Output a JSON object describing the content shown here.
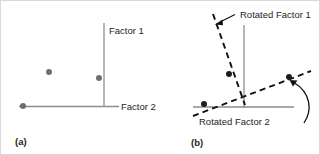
{
  "figure": {
    "width": 320,
    "height": 155,
    "background": "#ffffff",
    "type": "statistical-diagram"
  },
  "colors": {
    "axis_gray": "#8d8d8d",
    "point_gray": "#6e6e6e",
    "point_dark": "#1d1d1d",
    "dashed_black": "#111111",
    "text": "#231f20",
    "background": "#ffffff"
  },
  "panel_a": {
    "caption": "(a)",
    "vertical_axis_label": "Factor 1",
    "horizontal_axis_label": "Factor 2",
    "axes": {
      "vertical_x": 103,
      "vertical_y_top": 22,
      "vertical_y_bottom": 106,
      "horizontal_y": 105.5,
      "horizontal_x_left": 18,
      "horizontal_x_right": 118
    },
    "points": [
      {
        "name": "point-left-on-axis",
        "x": 22,
        "y": 105,
        "r": 3.0
      },
      {
        "name": "point-upper-middle",
        "x": 48,
        "y": 71,
        "r": 3.0
      },
      {
        "name": "point-right",
        "x": 98,
        "y": 77,
        "r": 3.0
      }
    ],
    "label_positions": {
      "vertical_label_x": 108,
      "vertical_label_y": 33,
      "horizontal_label_x": 120,
      "horizontal_label_y": 109,
      "caption_x": 14,
      "caption_y": 144
    }
  },
  "panel_b": {
    "caption": "(b)",
    "rotated_factor_1_label": "Rotated Factor 1",
    "rotated_factor_2_label": "Rotated Factor 2",
    "axes": {
      "vertical_x": 243,
      "vertical_y_top": 24,
      "vertical_y_bottom": 107,
      "horizontal_y": 106,
      "horizontal_x_left": 192,
      "horizontal_x_right": 293
    },
    "rotated_axis_1": {
      "x1": 212,
      "y1": 13,
      "x2": 244,
      "y2": 104,
      "description": "steep dashed line tilted left from vertical"
    },
    "rotated_axis_2": {
      "x1": 192,
      "y1": 115,
      "x2": 310,
      "y2": 70,
      "description": "dashed line tilted up to the right from horizontal"
    },
    "points": [
      {
        "name": "point-lower-left",
        "x": 203,
        "y": 103,
        "r": 3.0
      },
      {
        "name": "point-on-rotated-factor-1",
        "x": 228,
        "y": 73,
        "r": 3.0
      },
      {
        "name": "point-upper-right",
        "x": 288,
        "y": 76,
        "r": 3.0
      }
    ],
    "pointer_arrow": {
      "from_x": 232,
      "from_y": 14,
      "to_x": 215,
      "to_y": 23,
      "description": "short straight arrow from Rotated Factor 1 label to dashed axis"
    },
    "curved_arrow": {
      "start_x": 303,
      "start_y": 122,
      "ctrl_x": 309,
      "ctrl_y": 96,
      "end_x": 290,
      "end_y": 80,
      "description": "curved arrow sweeping counter-clockwise to the upper-right point"
    },
    "label_positions": {
      "rf1_label_x": 239,
      "rf1_label_y": 17,
      "rf2_label_x": 198,
      "rf2_label_y": 124,
      "caption_x": 190,
      "caption_y": 145
    }
  }
}
